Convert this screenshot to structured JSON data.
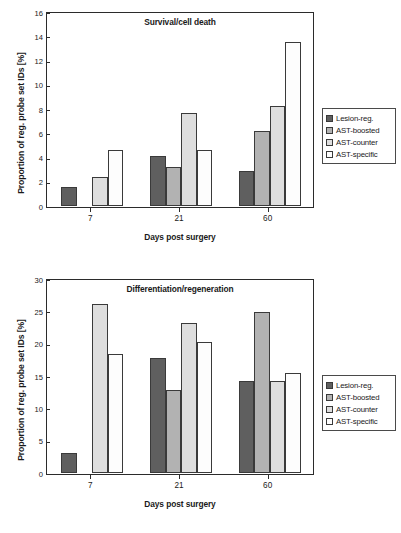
{
  "figure": {
    "series_labels": [
      "Lesion-reg.",
      "AST-boosted",
      "AST-counter",
      "AST-specific"
    ],
    "series_colors": [
      "#5f5f5f",
      "#b2b2b2",
      "#dedede",
      "#fdfdfd"
    ],
    "legend_position": "right"
  },
  "chart_data": [
    {
      "type": "bar",
      "title": "Survival/cell death",
      "xlabel": "Days post surgery",
      "ylabel": "Proportion of reg. probe set IDs [%]",
      "categories": [
        "7",
        "21",
        "60"
      ],
      "yticks": [
        0,
        2,
        4,
        6,
        8,
        10,
        12,
        14,
        16
      ],
      "ylim": [
        0,
        16
      ],
      "grid": false,
      "legend": [
        "Lesion-reg.",
        "AST-boosted",
        "AST-counter",
        "AST-specific"
      ],
      "series": [
        {
          "name": "Lesion-reg.",
          "values": [
            1.55,
            4.15,
            2.85
          ]
        },
        {
          "name": "AST-boosted",
          "values": [
            0,
            3.2,
            6.2
          ]
        },
        {
          "name": "AST-counter",
          "values": [
            2.4,
            7.7,
            8.25
          ]
        },
        {
          "name": "AST-specific",
          "values": [
            4.6,
            4.6,
            13.55
          ]
        }
      ]
    },
    {
      "type": "bar",
      "title": "Differentiation/regeneration",
      "xlabel": "Days post surgery",
      "ylabel": "Proportion of reg. probe set IDs [%]",
      "categories": [
        "7",
        "21",
        "60"
      ],
      "yticks": [
        0,
        5,
        10,
        15,
        20,
        25,
        30
      ],
      "ylim": [
        0,
        30
      ],
      "grid": false,
      "legend": [
        "Lesion-reg.",
        "AST-boosted",
        "AST-counter",
        "AST-specific"
      ],
      "series": [
        {
          "name": "Lesion-reg.",
          "values": [
            3.1,
            17.8,
            14.3
          ]
        },
        {
          "name": "AST-boosted",
          "values": [
            0,
            12.9,
            24.9
          ]
        },
        {
          "name": "AST-counter",
          "values": [
            26.1,
            23.2,
            14.3
          ]
        },
        {
          "name": "AST-specific",
          "values": [
            18.4,
            20.2,
            15.5
          ]
        }
      ]
    }
  ]
}
